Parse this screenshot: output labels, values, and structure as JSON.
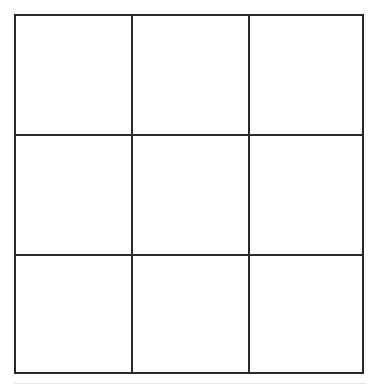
{
  "board": {
    "rows": 3,
    "cols": 3,
    "line_color": "#2a2a2a",
    "background": "#ffffff",
    "cells": [
      [
        "",
        "",
        ""
      ],
      [
        "",
        "",
        ""
      ],
      [
        "",
        "",
        ""
      ]
    ]
  }
}
